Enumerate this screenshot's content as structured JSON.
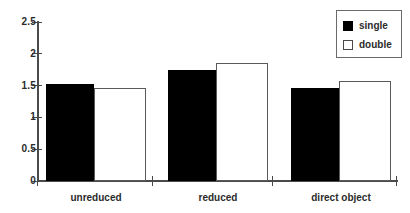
{
  "chart_data": {
    "type": "bar",
    "title": "",
    "xlabel": "",
    "ylabel": "",
    "categories": [
      "unreduced",
      "reduced",
      "direct object"
    ],
    "series": [
      {
        "name": "single",
        "color": "#000000",
        "values": [
          1.53,
          1.74,
          1.46
        ]
      },
      {
        "name": "double",
        "color": "#ffffff",
        "values": [
          1.47,
          1.86,
          1.58
        ]
      }
    ],
    "ylim": [
      0,
      2.5
    ],
    "yticks": [
      0,
      0.5,
      1,
      1.5,
      2,
      2.5
    ],
    "ytick_labels": [
      "0",
      "0.5",
      "1",
      "1.5",
      "2",
      "2.5"
    ],
    "grid": false,
    "legend": {
      "position": "top-right",
      "entries": [
        {
          "label": "single",
          "swatch": "filled-black-square"
        },
        {
          "label": "double",
          "swatch": "open-white-square"
        }
      ]
    }
  }
}
